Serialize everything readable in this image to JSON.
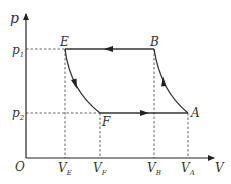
{
  "diagram": {
    "axes": {
      "y_label": "p",
      "x_label": "V",
      "origin_label": "O"
    },
    "pressure_levels": [
      {
        "label": "p",
        "subscript": "1"
      },
      {
        "label": "p",
        "subscript": "2"
      }
    ],
    "volume_levels": [
      {
        "label": "V",
        "subscript": "E"
      },
      {
        "label": "V",
        "subscript": "F"
      },
      {
        "label": "V",
        "subscript": "B"
      },
      {
        "label": "V",
        "subscript": "A"
      }
    ],
    "points": {
      "E": "E",
      "B": "B",
      "F": "F",
      "A": "A"
    },
    "processes": [
      {
        "from": "A",
        "to": "B",
        "type": "curve"
      },
      {
        "from": "B",
        "to": "E",
        "type": "isobaric"
      },
      {
        "from": "E",
        "to": "F",
        "type": "curve"
      },
      {
        "from": "F",
        "to": "A",
        "type": "isobaric"
      }
    ],
    "colors": {
      "line": "#333333",
      "dashed": "#555555"
    }
  }
}
